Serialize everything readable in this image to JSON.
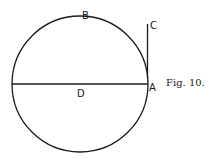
{
  "figure": {
    "caption": "Fig. 10.",
    "labels": {
      "A": "A",
      "B": "B",
      "C": "C",
      "D": "D"
    },
    "elements": [
      "circle",
      "diameter D through center ending at A",
      "tangent line AC at point A"
    ]
  }
}
